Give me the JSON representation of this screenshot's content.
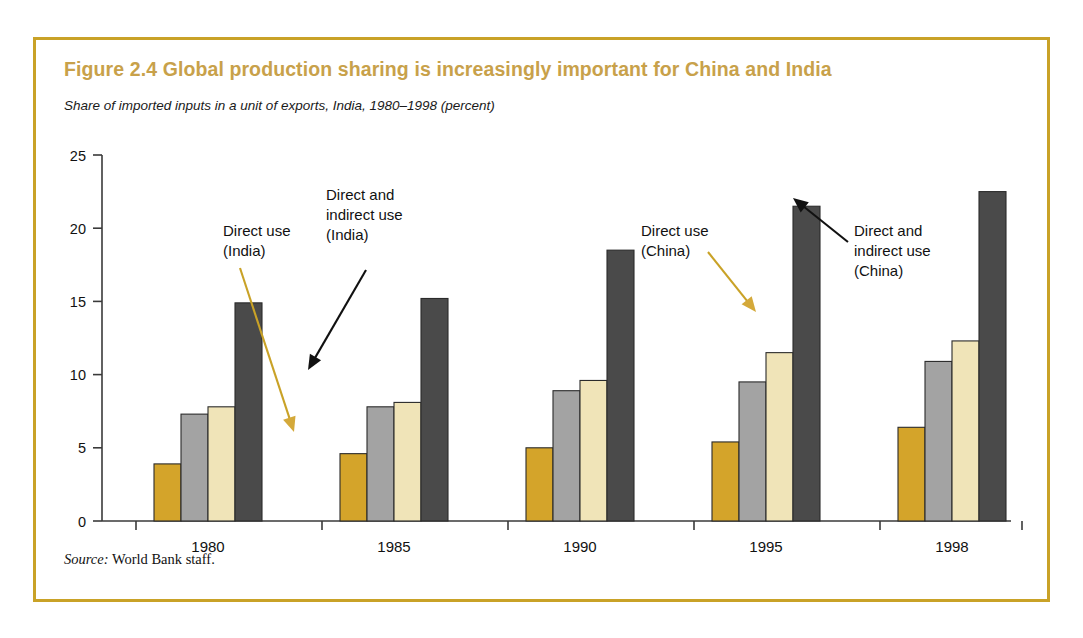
{
  "figure": {
    "title": "Figure 2.4  Global production sharing is increasingly important for China and India",
    "subtitle": "Share of imported inputs in a unit of exports, India, 1980–1998 (percent)",
    "source_label": "Source:",
    "source_text": " World Bank staff.",
    "border_color": "#c9a227",
    "title_color": "#c8a14a"
  },
  "annotations": [
    {
      "id": "direct-use-india",
      "lines": [
        "Direct use",
        "(India)"
      ],
      "color": "#c9a227"
    },
    {
      "id": "direct-indirect-use-india",
      "lines": [
        "Direct and",
        "indirect use",
        "(India)"
      ],
      "color": "#111111"
    },
    {
      "id": "direct-use-china",
      "lines": [
        "Direct use",
        "(China)"
      ],
      "color": "#c9a227"
    },
    {
      "id": "direct-indirect-use-china",
      "lines": [
        "Direct and",
        "indirect use",
        "(China)"
      ],
      "color": "#111111"
    }
  ],
  "chart_data": {
    "type": "bar",
    "title": "Figure 2.4  Global production sharing is increasingly important for China and India",
    "subtitle": "Share of imported inputs in a unit of exports, India, 1980–1998 (percent)",
    "xlabel": "",
    "ylabel": "",
    "ylim": [
      0,
      25
    ],
    "yticks": [
      0,
      5,
      10,
      15,
      20,
      25
    ],
    "ytick_labels": [
      "0",
      "5",
      "10",
      "15",
      "20",
      "25"
    ],
    "grid": false,
    "legend_position": "none",
    "categories": [
      "1980",
      "1985",
      "1990",
      "1995",
      "1998"
    ],
    "series": [
      {
        "name": "Direct use (India)",
        "color": "#d4a42a",
        "values": [
          3.9,
          4.6,
          5.0,
          5.4,
          6.4
        ]
      },
      {
        "name": "Direct and indirect use (India)",
        "color": "#a3a3a3",
        "values": [
          7.3,
          7.8,
          8.9,
          9.5,
          10.9
        ]
      },
      {
        "name": "Direct use (China)",
        "color": "#f0e4b8",
        "values": [
          7.8,
          8.1,
          9.6,
          11.5,
          12.3
        ]
      },
      {
        "name": "Direct and indirect use (China)",
        "color": "#4a4a4a",
        "values": [
          14.9,
          15.2,
          18.5,
          21.5,
          22.5
        ]
      }
    ]
  }
}
